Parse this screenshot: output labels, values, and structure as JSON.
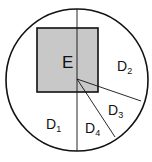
{
  "diagram": {
    "colors": {
      "stroke": "#111111",
      "square_fill": "#c8c8c8",
      "background": "#ffffff"
    },
    "circle": {
      "cx": 77,
      "cy": 80,
      "r": 71
    },
    "square": {
      "x": 37,
      "y": 28,
      "width": 61,
      "height": 64,
      "label": "E"
    },
    "center_point": {
      "x": 77,
      "y": 79
    },
    "lines": [
      {
        "name": "vertical-diameter",
        "x1": 77,
        "y1": 9,
        "x2": 77,
        "y2": 151
      },
      {
        "name": "ray-to-right",
        "x1": 77,
        "y1": 79,
        "x2": 141,
        "y2": 101
      },
      {
        "name": "ray-to-lower-right",
        "x1": 77,
        "y1": 79,
        "x2": 115,
        "y2": 137
      }
    ],
    "regions": [
      {
        "id": "E",
        "main": "E",
        "sub": "",
        "x": 62,
        "y": 68
      },
      {
        "id": "D1",
        "main": "D",
        "sub": "1",
        "x": 46,
        "y": 129
      },
      {
        "id": "D2",
        "main": "D",
        "sub": "2",
        "x": 117,
        "y": 71
      },
      {
        "id": "D3",
        "main": "D",
        "sub": "3",
        "x": 108,
        "y": 115
      },
      {
        "id": "D4",
        "main": "D",
        "sub": "4",
        "x": 85,
        "y": 133
      }
    ]
  }
}
